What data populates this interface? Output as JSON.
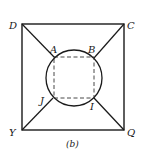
{
  "diagram": {
    "caption": "(b)",
    "labels": {
      "D": "D",
      "C": "C",
      "Y": "Y",
      "Q": "Q",
      "A": "A",
      "B": "B",
      "J": "J",
      "I": "I"
    },
    "colors": {
      "stroke": "#1a1a1a",
      "background": "#ffffff"
    }
  }
}
